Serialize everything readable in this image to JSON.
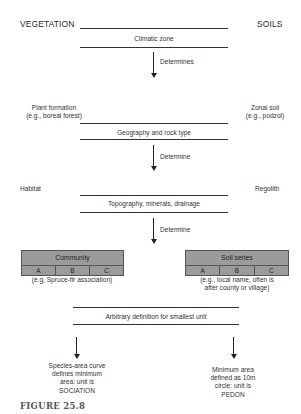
{
  "headers": {
    "left": "VEGETATION",
    "right": "SOILS"
  },
  "levels": [
    {
      "band": "Climatic zone",
      "arrow_label": "Determines"
    },
    {
      "left_label": [
        "Plant formation",
        "(e.g., boreal forest)"
      ],
      "right_label": [
        "Zonal soil",
        "(e.g., podzol)"
      ],
      "band": "Geography and rock type",
      "arrow_label": "Determine"
    },
    {
      "left_label": [
        "Habitat"
      ],
      "right_label": [
        "Regolith"
      ],
      "band": "Topography, minerals, drainage",
      "arrow_label": "Determine"
    }
  ],
  "boxes": {
    "left": {
      "title": "Community",
      "cells": [
        "A",
        "B",
        "C"
      ],
      "caption": [
        "(e.g, Spruce-fir association)"
      ]
    },
    "right": {
      "title": "Soil series",
      "cells": [
        "A",
        "B",
        "C"
      ],
      "caption": [
        "(e.g., local name, often is",
        "after county or village)"
      ]
    }
  },
  "final_band": "Arbitrary definition for smallest unit",
  "outcomes": {
    "left": [
      "Species-area curve",
      "defines minimum",
      "area: unit is",
      "SOCIATION"
    ],
    "right": [
      "Minimum area",
      "defined as 10m",
      "circle: unit is",
      "PEDON"
    ]
  },
  "figure_label": "FIGURE 25.8",
  "colors": {
    "box_fill": "#9b9b9b",
    "line": "#333333",
    "figure_label": "#555555"
  }
}
